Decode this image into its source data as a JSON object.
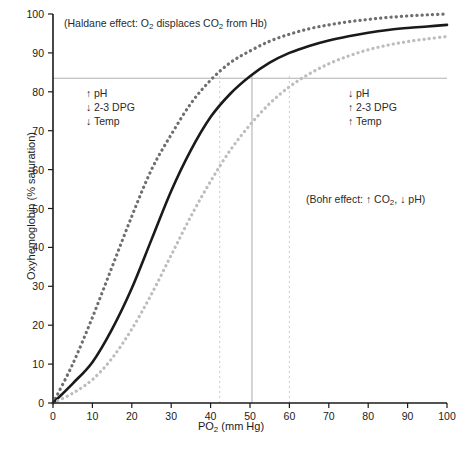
{
  "chart_data": {
    "type": "line",
    "title": "",
    "xlabel": "PO2 (mm Hg)",
    "ylabel": "Oxyhemoglobin (% saturation)",
    "xlim": [
      0,
      100
    ],
    "ylim": [
      0,
      100
    ],
    "grid": false,
    "legend_position": "none",
    "x_ticks": [
      0,
      10,
      20,
      30,
      40,
      50,
      60,
      70,
      80,
      90,
      100
    ],
    "y_ticks": [
      0,
      10,
      20,
      30,
      40,
      50,
      60,
      70,
      80,
      90,
      100
    ],
    "x": [
      0,
      5,
      10,
      15,
      20,
      25,
      30,
      35,
      40,
      45,
      50,
      55,
      60,
      65,
      70,
      75,
      80,
      85,
      90,
      95,
      100
    ],
    "series": [
      {
        "name": "Left-shifted curve (increased O2 affinity)",
        "style": "dotted",
        "color": "#6e6e6e",
        "values": [
          0,
          10,
          22,
          35,
          48,
          60,
          69,
          77,
          83,
          87.5,
          90.5,
          93,
          94.8,
          96.2,
          97.2,
          98,
          98.6,
          99.1,
          99.5,
          99.8,
          100
        ]
      },
      {
        "name": "Normal curve",
        "style": "solid",
        "color": "#1a1a1a",
        "values": [
          0,
          5,
          10.5,
          19,
          29.5,
          42,
          54.5,
          65,
          73.5,
          79.5,
          84,
          87.5,
          90,
          91.8,
          93.2,
          94.3,
          95.2,
          95.9,
          96.4,
          96.8,
          97.2
        ]
      },
      {
        "name": "Right-shifted curve (decreased O2 affinity)",
        "style": "dotted",
        "color": "#bdbdbd",
        "values": [
          0,
          2.5,
          6,
          11.5,
          19,
          28,
          38,
          48,
          57,
          65,
          71.5,
          77,
          81.3,
          84.6,
          87.2,
          89.2,
          90.8,
          92,
          92.9,
          93.6,
          94.2
        ]
      }
    ],
    "reference_lines": [
      {
        "name": "saturation-reference",
        "orientation": "horizontal",
        "value": 83.5,
        "style": "solid",
        "color": "#b0b0b0"
      },
      {
        "name": "po2-normal-reference",
        "orientation": "vertical",
        "value": 50.5,
        "style": "solid",
        "color": "#b0b0b0"
      },
      {
        "name": "po2-left-reference",
        "orientation": "vertical",
        "value": 42.3,
        "style": "dashed",
        "color": "#cfcfcf"
      },
      {
        "name": "po2-right-reference",
        "orientation": "vertical",
        "value": 60,
        "style": "dashed",
        "color": "#cfcfcf"
      }
    ],
    "annotations": [
      {
        "name": "haldane-effect",
        "text": "(Haldane effect: O2 displaces CO2 from Hb)",
        "x": 3,
        "y": 96
      },
      {
        "name": "left-shift-factors",
        "text": "↑ pH / ↓ 2-3 DPG / ↓ Temp",
        "x": 9,
        "y": 80
      },
      {
        "name": "right-shift-factors",
        "text": "↓ pH / ↑ 2-3 DPG / ↑ Temp",
        "x": 75,
        "y": 80
      },
      {
        "name": "bohr-effect",
        "text": "(Bohr effect: ↑ CO2, ↓ pH)",
        "x": 64,
        "y": 53
      }
    ]
  },
  "axes": {
    "x_title_main": "PO",
    "x_title_sub": "2",
    "x_title_rest": " (mm Hg)",
    "y_title": "Oxyhemoglobin (% saturation)"
  },
  "annotations": {
    "haldane": {
      "open": "(Haldane effect: O",
      "sub1": "2",
      "mid": " displaces CO",
      "sub2": "2",
      "close": " from Hb)"
    },
    "left_block": {
      "line1_arrow": "↑",
      "line1_text": "pH",
      "line2_arrow": "↓",
      "line2_text": "2-3 DPG",
      "line3_arrow": "↓",
      "line3_text": "Temp"
    },
    "right_block": {
      "line1_arrow": "↓",
      "line1_text": "pH",
      "line2_arrow": "↑",
      "line2_text": "2-3 DPG",
      "line3_arrow": "↑",
      "line3_text": "Temp"
    },
    "bohr": {
      "open": "(Bohr effect: ↑ CO",
      "sub1": "2",
      "mid": ", ↓ pH)"
    }
  },
  "caption_strip": ""
}
